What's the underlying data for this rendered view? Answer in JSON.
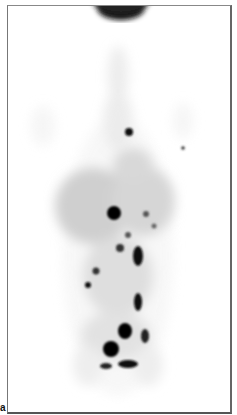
{
  "figure": {
    "panel_label": "a",
    "colors": {
      "background": "#ffffff",
      "tracer_uptake": "#000000",
      "frame": "#666666"
    }
  }
}
